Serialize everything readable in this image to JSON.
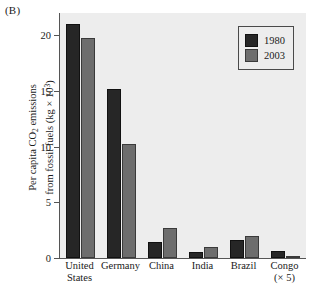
{
  "panel_label": "(B)",
  "chart_data": {
    "type": "bar",
    "title": "",
    "panel": "(B)",
    "xlabel": "",
    "ylabel": "Per capita CO2 emissions from fossil fuels (kg × 10^3)",
    "ylabel_lines": [
      "Per capita CO",
      " emissions",
      "from fossil fuels (kg × 10",
      ")"
    ],
    "ylabel_parts": {
      "line1_a": "Per capita CO",
      "line1_sub": "2",
      "line1_b": " emissions",
      "line2_a": "from fossil fuels (kg × 10",
      "line2_sup": "3",
      "line2_b": ")"
    },
    "categories": [
      "United States",
      "Germany",
      "China",
      "India",
      "Brazil",
      "Congo (× 5)"
    ],
    "category_lines": [
      [
        "United",
        "States"
      ],
      [
        "Germany"
      ],
      [
        "China"
      ],
      [
        "India"
      ],
      [
        "Brazil"
      ],
      [
        "Congo",
        "(× 5)"
      ]
    ],
    "series": [
      {
        "name": "1980",
        "color": "#262626",
        "values": [
          21.0,
          15.2,
          1.4,
          0.5,
          1.6,
          0.6
        ]
      },
      {
        "name": "2003",
        "color": "#6d6d6d",
        "values": [
          19.8,
          10.2,
          2.7,
          1.0,
          2.0,
          0.15
        ]
      }
    ],
    "ylim": [
      0,
      22
    ],
    "yticks": [
      0,
      5,
      10,
      15,
      20
    ],
    "ytick_labels": [
      "0",
      "5",
      "10",
      "15",
      "20"
    ],
    "grid": false,
    "legend_position": "top-right",
    "plot_background": "#ededed"
  },
  "legend": {
    "entries": [
      {
        "label": "1980"
      },
      {
        "label": "2003"
      }
    ]
  }
}
